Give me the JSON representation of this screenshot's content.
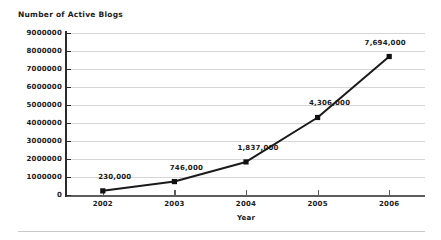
{
  "chart_data": {
    "type": "line",
    "title": "Number of Active Blogs",
    "xlabel": "Year",
    "ylabel": "",
    "categories": [
      "2002",
      "2003",
      "2004",
      "2005",
      "2006"
    ],
    "values": [
      230000,
      746000,
      1837000,
      4306000,
      7694000
    ],
    "point_labels": [
      "230,000",
      "746,000",
      "1,837,000",
      "4,306,000",
      "7,694,000"
    ],
    "series": [
      {
        "name": "Number of Active Blogs",
        "values": [
          230000,
          746000,
          1837000,
          4306000,
          7694000
        ]
      }
    ],
    "ylim": [
      0,
      9000000
    ],
    "xlim": [
      "2002",
      "2006"
    ],
    "y_ticks": [
      0,
      1000000,
      2000000,
      3000000,
      4000000,
      5000000,
      6000000,
      7000000,
      8000000,
      9000000
    ],
    "y_tick_labels": [
      "0",
      "1000000",
      "2000000",
      "3000000",
      "4000000",
      "5000000",
      "6000000",
      "7000000",
      "8000000",
      "9000000"
    ],
    "grid": true,
    "grid_axis": "y",
    "legend": false,
    "legend_position": "none",
    "marker": "square",
    "line_color": "#1a1a1a",
    "marker_color": "#111111",
    "grid_color": "#d6d6d6",
    "axis_color": "#2b2b2b",
    "background_color": "#ffffff"
  }
}
